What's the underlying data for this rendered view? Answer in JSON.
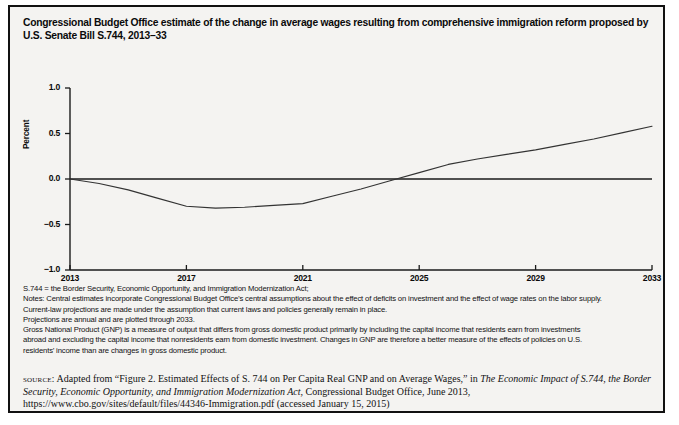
{
  "figure": {
    "title": "Congressional Budget Office estimate of the change in average wages resulting from comprehensive immigration reform proposed by U.S. Senate Bill S.744, 2013–33",
    "border_color": "#111111",
    "background_color": "#f4f3f1"
  },
  "chart_data": {
    "type": "line",
    "title": "Congressional Budget Office estimate of the change in average wages resulting from comprehensive immigration reform proposed by U.S. Senate Bill S.744, 2013–33",
    "xlabel": "",
    "ylabel": "Percent",
    "xlim": [
      2013,
      2033
    ],
    "ylim": [
      -1.0,
      1.0
    ],
    "grid": false,
    "legend": "none",
    "xticks": [
      "2013",
      "2017",
      "2021",
      "2025",
      "2029",
      "2033"
    ],
    "xtick_values": [
      2013,
      2017,
      2021,
      2025,
      2029,
      2033
    ],
    "yticks": [
      "1.0",
      "0.5",
      "0.0",
      "−0.5",
      "−1.0"
    ],
    "ytick_values": [
      1.0,
      0.5,
      0.0,
      -0.5,
      -1.0
    ],
    "zero_reference_line": 0.0,
    "series": [
      {
        "name": "Change in average wages",
        "color": "#333333",
        "x": [
          2013,
          2014,
          2015,
          2016,
          2017,
          2018,
          2019,
          2020,
          2021,
          2022,
          2023,
          2024,
          2025,
          2026,
          2027,
          2028,
          2029,
          2030,
          2031,
          2032,
          2033
        ],
        "values": [
          0.0,
          -0.05,
          -0.12,
          -0.21,
          -0.3,
          -0.32,
          -0.31,
          -0.29,
          -0.27,
          -0.19,
          -0.11,
          -0.02,
          0.07,
          0.16,
          0.22,
          0.27,
          0.32,
          0.38,
          0.44,
          0.51,
          0.58
        ]
      }
    ],
    "annotations": []
  },
  "notes": {
    "lines": [
      "S.744 = the Border Security, Economic Opportunity, and Immigration Modernization Act;",
      "Notes: Central estimates incorporate Congressional Budget Office’s central assumptions about the effect of deficits on investment and the effect of wage rates on the labor supply.",
      "Current-law projections are made under the assumption that current laws and policies generally remain in place.",
      "Projections are annual and are plotted through 2033.",
      "Gross National Product (GNP) is a measure of output that differs from gross domestic product primarily by including the capital income that residents earn from investments",
      "abroad and excluding the capital income that nonresidents earn from domestic investment. Changes in GNP are therefore a better measure of the effects of policies on U.S.",
      "residents’ income than are changes in gross domestic product."
    ]
  },
  "source": {
    "label": "source:",
    "part1": " Adapted from “Figure 2. Estimated Effects of S. 744 on Per Capita Real GNP and on Average Wages,” in ",
    "italic1": "The Economic Impact of S.744, the Border Security, Economic Opportunity, and Immigration Modernization Act",
    "part2": ", Congressional Budget Office, June 2013, https://www.cbo.gov/sites/default/files/44346-Immigration.pdf (accessed January 15, 2015)"
  }
}
